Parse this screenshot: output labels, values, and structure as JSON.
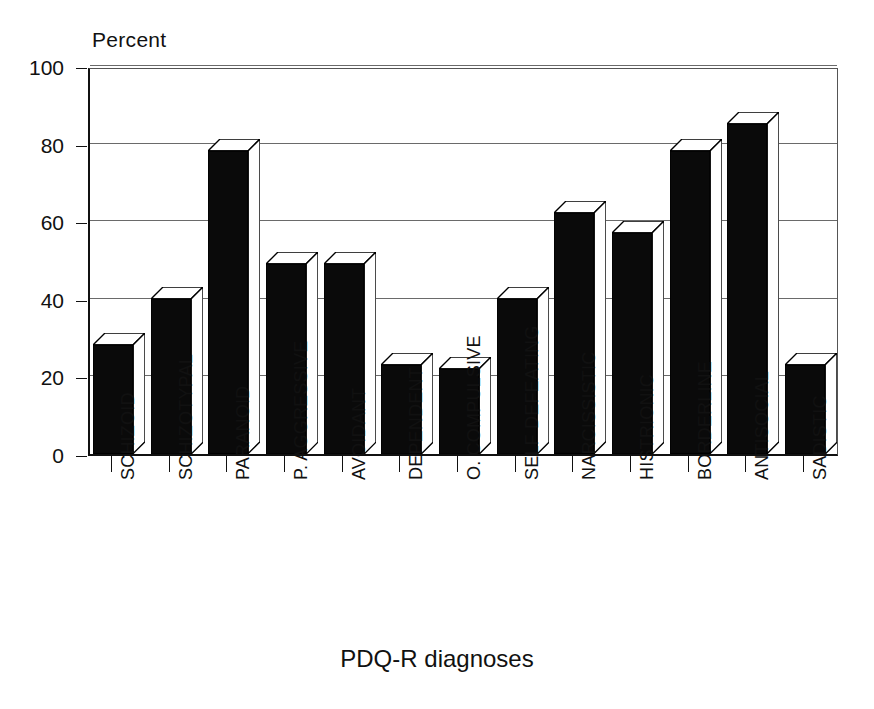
{
  "chart_data": {
    "type": "bar",
    "title": "",
    "ylabel": "Percent",
    "xlabel": "PDQ-R diagnoses",
    "ylim": [
      0,
      100
    ],
    "yticks": [
      0,
      20,
      40,
      60,
      80,
      100
    ],
    "grid": true,
    "legend": "none",
    "style": "3d-black-bars",
    "categories": [
      "SCHIZOID",
      "SCHIZOTYPAL",
      "PARANOID",
      "P. AGGRESSIVE",
      "AVOIDANT",
      "DEPENDENT",
      "O. COMPULSIVE",
      "SELF DEFEATING",
      "NARCISSISTIC",
      "HISTRIONIC",
      "BORDERLINE",
      "ANTISOCIAL",
      "SADISTIC"
    ],
    "values": [
      28,
      40,
      78,
      49,
      49,
      23,
      22,
      40,
      62,
      57,
      78,
      85,
      23
    ]
  },
  "colors": {
    "bar_fill": "#0a0a0a",
    "bar_outline": "#000000",
    "bar_highlight": "#ffffff",
    "axis": "#111111",
    "grid": "#6a6a6a",
    "background": "#ffffff"
  }
}
